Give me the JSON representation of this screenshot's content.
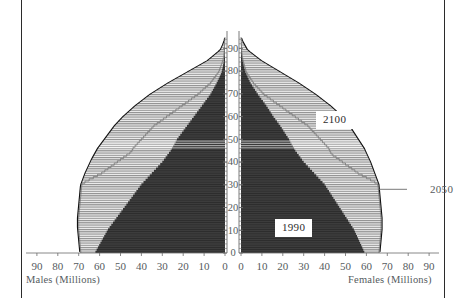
{
  "figure": {
    "left_axis_caption": "Males (Millions)",
    "right_axis_caption": "Females (Millions)",
    "callout_2050": "2050",
    "label_2100": "2100",
    "label_1990": "1990"
  },
  "colors": {
    "frame": "#2b2b2b",
    "outline": "#111111",
    "fill_1990": "#3c3c3c",
    "fill_future": "#d8d8d8",
    "hatch_line": "#8d8d8d",
    "text": "#555b5e",
    "axis": "#6b6b6b",
    "box_bg": "#ffffff"
  },
  "chart_data": {
    "type": "bar",
    "title": "",
    "subtitle": "",
    "orientation": "horizontal-population-pyramid",
    "xlabel_left": "Males (Millions)",
    "xlabel_right": "Females (Millions)",
    "ylabel": "Age",
    "xlim_left": [
      90,
      0
    ],
    "xlim_right": [
      0,
      90
    ],
    "ylim": [
      0,
      95
    ],
    "grid": false,
    "legend_position": "in-plot-annotations",
    "x_ticks_left": [
      90,
      80,
      70,
      60,
      50,
      40,
      30,
      20,
      10,
      0
    ],
    "x_ticks_right": [
      0,
      10,
      20,
      30,
      40,
      50,
      60,
      70,
      80,
      90
    ],
    "y_ticks": [
      0,
      10,
      20,
      30,
      40,
      50,
      60,
      70,
      80,
      90
    ],
    "annotations": [
      {
        "text": "2100",
        "x_right": 34,
        "age": 60
      },
      {
        "text": "1990",
        "x_right": 10,
        "age": 10
      },
      {
        "text": "2050",
        "x_right": 92,
        "age": 28,
        "leader_line": true
      }
    ],
    "ages": [
      0,
      1,
      2,
      3,
      4,
      5,
      6,
      7,
      8,
      9,
      10,
      11,
      12,
      13,
      14,
      15,
      16,
      17,
      18,
      19,
      20,
      21,
      22,
      23,
      24,
      25,
      26,
      27,
      28,
      29,
      30,
      31,
      32,
      33,
      34,
      35,
      36,
      37,
      38,
      39,
      40,
      41,
      42,
      43,
      44,
      45,
      46,
      47,
      48,
      49,
      50,
      51,
      52,
      53,
      54,
      55,
      56,
      57,
      58,
      59,
      60,
      61,
      62,
      63,
      64,
      65,
      66,
      67,
      68,
      69,
      70,
      71,
      72,
      73,
      74,
      75,
      76,
      77,
      78,
      79,
      80,
      81,
      82,
      83,
      84,
      85,
      86,
      87,
      88,
      89,
      90,
      91,
      92,
      93,
      94,
      95
    ],
    "series": [
      {
        "name": "2100",
        "side": "males",
        "values": [
          69.5,
          69.6,
          69.7,
          69.8,
          69.9,
          70.0,
          70.1,
          70.2,
          70.3,
          70.4,
          70.5,
          70.6,
          70.6,
          70.6,
          70.6,
          70.6,
          70.5,
          70.4,
          70.3,
          70.2,
          70.1,
          70.0,
          69.9,
          69.8,
          69.7,
          69.6,
          69.5,
          69.4,
          69.3,
          69.2,
          69.0,
          68.6,
          68.2,
          67.8,
          67.4,
          67.0,
          66.5,
          66.0,
          65.5,
          65.0,
          64.5,
          64.0,
          63.4,
          62.8,
          62.2,
          61.6,
          61.0,
          60.2,
          59.4,
          58.6,
          57.8,
          57.0,
          56.2,
          55.4,
          54.6,
          53.8,
          53.0,
          52.0,
          51.0,
          50.0,
          49.0,
          47.8,
          46.6,
          45.4,
          44.2,
          43.0,
          41.6,
          40.2,
          38.8,
          37.4,
          36.0,
          34.3,
          32.6,
          30.9,
          29.2,
          27.5,
          25.6,
          23.7,
          21.8,
          19.9,
          18.0,
          16.1,
          14.2,
          12.3,
          10.4,
          8.5,
          7.2,
          5.9,
          4.6,
          3.3,
          2.2,
          1.7,
          1.2,
          0.8,
          0.4,
          0.2
        ]
      },
      {
        "name": "2100",
        "side": "females",
        "values": [
          66.5,
          66.6,
          66.7,
          66.8,
          66.9,
          67.0,
          67.1,
          67.2,
          67.3,
          67.4,
          67.5,
          67.5,
          67.5,
          67.5,
          67.5,
          67.5,
          67.4,
          67.3,
          67.2,
          67.1,
          67.0,
          66.9,
          66.8,
          66.7,
          66.6,
          66.5,
          66.4,
          66.3,
          66.2,
          66.1,
          66.0,
          65.6,
          65.2,
          64.8,
          64.4,
          64.0,
          63.6,
          63.2,
          62.8,
          62.4,
          62.0,
          61.5,
          61.0,
          60.5,
          60.0,
          59.5,
          59.0,
          58.3,
          57.6,
          56.9,
          56.2,
          55.5,
          54.8,
          54.1,
          53.4,
          52.7,
          52.0,
          51.2,
          50.4,
          49.6,
          48.8,
          47.6,
          46.4,
          45.2,
          44.0,
          42.8,
          41.4,
          40.0,
          38.6,
          37.2,
          35.8,
          34.2,
          32.6,
          31.0,
          29.4,
          27.8,
          26.0,
          24.2,
          22.4,
          20.6,
          18.8,
          17.0,
          15.2,
          13.4,
          11.6,
          9.8,
          8.4,
          7.0,
          5.6,
          4.2,
          3.0,
          2.4,
          1.8,
          1.2,
          0.7,
          0.3
        ]
      },
      {
        "name": "2050",
        "side": "males",
        "values": [
          69.0,
          69.1,
          69.2,
          69.3,
          69.4,
          69.5,
          69.6,
          69.7,
          69.8,
          69.9,
          70.0,
          70.0,
          70.0,
          70.0,
          70.0,
          70.0,
          69.9,
          69.8,
          69.7,
          69.6,
          69.5,
          69.4,
          69.3,
          69.2,
          69.1,
          69.0,
          68.9,
          68.8,
          68.7,
          68.6,
          68.4,
          67.0,
          65.0,
          63.0,
          61.0,
          59.0,
          57.5,
          56.0,
          54.5,
          53.0,
          51.5,
          50.0,
          48.5,
          47.0,
          45.5,
          44.5,
          44.0,
          43.0,
          42.0,
          41.0,
          40.0,
          39.0,
          38.0,
          37.0,
          36.0,
          35.0,
          34.0,
          32.5,
          31.0,
          29.5,
          28.0,
          26.5,
          25.0,
          23.5,
          22.0,
          20.5,
          19.0,
          17.5,
          16.0,
          14.5,
          13.0,
          11.8,
          10.6,
          9.4,
          8.2,
          7.0,
          6.2,
          5.4,
          4.6,
          3.8,
          3.0,
          2.6,
          2.2,
          1.8,
          1.4,
          1.0,
          0.8,
          0.6,
          0.5,
          0.4,
          0.3,
          0.2,
          0.15,
          0.1,
          0.05,
          0.02
        ]
      },
      {
        "name": "2050",
        "side": "females",
        "values": [
          66.0,
          66.1,
          66.2,
          66.3,
          66.4,
          66.5,
          66.6,
          66.7,
          66.8,
          66.9,
          67.0,
          67.0,
          67.0,
          67.0,
          67.0,
          67.0,
          66.9,
          66.8,
          66.7,
          66.6,
          66.5,
          66.4,
          66.3,
          66.2,
          66.1,
          66.0,
          65.9,
          65.8,
          65.7,
          65.6,
          65.4,
          64.0,
          62.0,
          60.0,
          58.0,
          56.0,
          54.5,
          53.0,
          51.5,
          50.0,
          48.5,
          47.0,
          45.5,
          44.0,
          43.0,
          42.5,
          42.0,
          41.0,
          40.0,
          39.0,
          38.0,
          37.0,
          36.0,
          35.0,
          34.0,
          33.0,
          32.0,
          30.5,
          29.0,
          27.5,
          26.0,
          24.5,
          23.0,
          21.5,
          20.0,
          18.5,
          17.0,
          15.5,
          14.0,
          12.5,
          11.0,
          10.0,
          9.0,
          8.0,
          7.0,
          6.0,
          5.3,
          4.6,
          3.9,
          3.2,
          2.5,
          2.2,
          1.9,
          1.6,
          1.3,
          1.0,
          0.8,
          0.6,
          0.5,
          0.4,
          0.3,
          0.2,
          0.15,
          0.1,
          0.05,
          0.02
        ]
      },
      {
        "name": "1990",
        "side": "males",
        "values": [
          62.0,
          61.4,
          60.8,
          60.2,
          59.6,
          59.0,
          58.4,
          57.8,
          57.2,
          56.6,
          56.0,
          55.2,
          54.4,
          53.6,
          52.8,
          52.0,
          51.2,
          50.4,
          49.6,
          48.8,
          48.0,
          47.2,
          46.4,
          45.6,
          44.8,
          44.0,
          43.2,
          42.4,
          41.6,
          40.8,
          40.0,
          39.0,
          38.0,
          37.0,
          36.0,
          35.0,
          34.0,
          33.0,
          32.0,
          31.0,
          30.0,
          29.2,
          28.4,
          27.6,
          26.8,
          26.0,
          25.4,
          24.8,
          24.2,
          23.6,
          23.0,
          22.2,
          21.4,
          20.6,
          19.8,
          19.0,
          18.2,
          17.4,
          16.6,
          15.8,
          15.0,
          14.2,
          13.4,
          12.6,
          11.8,
          11.0,
          10.2,
          9.4,
          8.6,
          7.8,
          7.0,
          6.4,
          5.8,
          5.2,
          4.6,
          4.0,
          3.5,
          3.0,
          2.5,
          2.0,
          1.6,
          1.35,
          1.1,
          0.9,
          0.7,
          0.55,
          0.45,
          0.35,
          0.27,
          0.2,
          0.15,
          0.1,
          0.07,
          0.04,
          0.02,
          0.01
        ]
      },
      {
        "name": "1990",
        "side": "females",
        "values": [
          59.0,
          58.5,
          58.0,
          57.5,
          57.0,
          56.5,
          56.0,
          55.5,
          55.0,
          54.5,
          54.0,
          53.3,
          52.6,
          51.9,
          51.2,
          50.5,
          49.8,
          49.1,
          48.4,
          47.7,
          47.0,
          46.3,
          45.6,
          44.9,
          44.2,
          43.5,
          42.8,
          42.1,
          41.4,
          40.7,
          40.0,
          39.0,
          38.0,
          37.0,
          36.0,
          35.0,
          34.0,
          33.0,
          32.0,
          31.0,
          30.0,
          29.2,
          28.4,
          27.6,
          26.8,
          26.0,
          25.4,
          24.8,
          24.2,
          23.6,
          23.0,
          22.3,
          21.6,
          20.9,
          20.2,
          19.5,
          18.8,
          18.0,
          17.2,
          16.4,
          15.6,
          14.9,
          14.2,
          13.5,
          12.8,
          12.1,
          11.3,
          10.5,
          9.7,
          8.9,
          8.1,
          7.4,
          6.7,
          6.0,
          5.3,
          4.6,
          4.1,
          3.6,
          3.1,
          2.6,
          2.1,
          1.8,
          1.5,
          1.25,
          1.0,
          0.8,
          0.65,
          0.5,
          0.4,
          0.3,
          0.22,
          0.16,
          0.1,
          0.06,
          0.03,
          0.01
        ]
      }
    ]
  }
}
